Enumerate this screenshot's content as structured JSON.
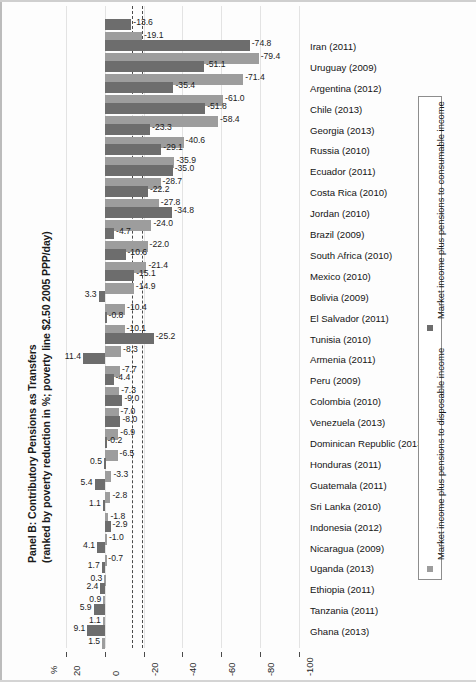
{
  "chart_data": {
    "type": "bar",
    "orientation": "horizontal",
    "title": "Panel B: Contributory Pensions as Transfers",
    "subtitle": "(ranked by poverty reduction in %; poverty line $2.50  2005 PPP/day)",
    "xlabel": "%",
    "ylabel": "",
    "xlim": [
      20,
      -100
    ],
    "xticks": [
      20,
      0,
      -20,
      -40,
      -60,
      -80,
      -100
    ],
    "xticklabels": [
      "20",
      "0",
      "-20",
      "-40",
      "-60",
      "-80",
      "-100"
    ],
    "grid": true,
    "legend_position": "right",
    "reference_lines": [
      -13.8,
      -19.3
    ],
    "series": [
      {
        "name": "Market income plus pensions to consumable income",
        "color": "#6d6d6d",
        "values": [
          -13.6,
          -74.8,
          -51.1,
          -35.4,
          -51.8,
          -23.3,
          -29.1,
          -35.0,
          -22.2,
          -34.8,
          -4.7,
          -10.6,
          -15.1,
          3.3,
          -0.8,
          -25.2,
          11.4,
          -4.4,
          -9.0,
          -8.0,
          -0.2,
          0.5,
          5.4,
          1.1,
          -2.9,
          4.1,
          1.7,
          2.4,
          5.9,
          9.1
        ]
      },
      {
        "name": "Market income plus pensions to disposable income",
        "color": "#9d9d9d",
        "values": [
          -19.1,
          -79.4,
          -71.4,
          -61.0,
          -58.4,
          -40.6,
          -35.9,
          -28.7,
          -27.8,
          -24.0,
          -22.0,
          -21.4,
          -14.9,
          -10.4,
          -10.1,
          -8.3,
          -7.7,
          -7.3,
          -7.0,
          -6.9,
          -6.5,
          -3.3,
          -2.8,
          -1.8,
          -1.0,
          -0.7,
          0.3,
          0.9,
          1.1,
          1.5
        ]
      }
    ],
    "categories": [
      "",
      "Iran (2011)",
      "Uruguay (2009)",
      "Argentina (2012)",
      "Chile (2013)",
      "Georgia (2013)",
      "Russia (2010)",
      "Ecuador (2011)",
      "Costa Rica (2010)",
      "Jordan (2010)",
      "Brazil (2009)",
      "South Africa (2010)",
      "Mexico (2010)",
      "Bolivia (2009)",
      "El Salvador (2011)",
      "Tunisia (2010)",
      "Armenia (2011)",
      "Peru (2009)",
      "Colombia (2010)",
      "Venezuela (2013)",
      "Dominican Republic (2013)",
      "Honduras (2011)",
      "Guatemala (2011)",
      "Sri Lanka (2010)",
      "Indonesia (2012)",
      "Nicaragua (2009)",
      "Uganda (2013)",
      "Ethiopia (2011)",
      "Tanzania (2011)",
      "Ghana (2013)"
    ],
    "datalabels": {
      "series1": [
        "-13.6",
        "-74.8",
        "-51.1",
        "-35.4",
        "-51.8",
        "-23.3",
        "-29.1",
        "-35.0",
        "-22.2",
        "-34.8",
        "-4.7",
        "-10.6",
        "-15.1",
        "3.3",
        "-0.8",
        "-25.2",
        "11.4",
        "-4.4",
        "-9.0",
        "-8.0",
        "-0.2",
        "0.5",
        "5.4",
        "1.1",
        "-2.9",
        "4.1",
        "1.7",
        "2.4",
        "5.9",
        "9.1"
      ],
      "series2": [
        "-19.1",
        "-79.4",
        "-71.4",
        "-61.0",
        "-58.4",
        "-40.6",
        "-35.9",
        "-28.7",
        "-27.8",
        "-24.0",
        "-22.0",
        "-21.4",
        "-14.9",
        "-10.4",
        "-10.1",
        "-8.3",
        "-7.7",
        "-7.3",
        "-7.0",
        "-6.9",
        "-6.5",
        "-3.3",
        "-2.8",
        "-1.8",
        "-1.0",
        "-0.7",
        "0.3",
        "0.9",
        "1.1",
        "1.5"
      ]
    }
  },
  "legend": {
    "items": [
      {
        "label": "Market income plus pensions to consumable income",
        "color": "#6d6d6d",
        "swatch": "legend-swatch-consumable"
      },
      {
        "label": "Market income plus pensions to disposable income",
        "color": "#9d9d9d",
        "swatch": "legend-swatch-disposable"
      }
    ]
  },
  "axis": {
    "percent_symbol": "%"
  }
}
